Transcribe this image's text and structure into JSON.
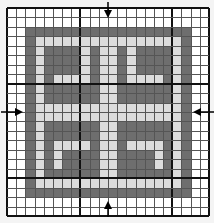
{
  "chart_data": {
    "type": "heatmap",
    "title": "",
    "cols": 22,
    "rows": 22,
    "bold_lines_every": 10,
    "bold_col_lines": [
      8,
      18
    ],
    "bold_row_lines": [
      8,
      18
    ],
    "palette": {
      "0": "#ffffff",
      "1": "#6e6e6e",
      "2": "#dcdcdc"
    },
    "legend": [
      {
        "value": 0,
        "label": "background"
      },
      {
        "value": 1,
        "label": "dark"
      },
      {
        "value": 2,
        "label": "light"
      }
    ],
    "center_markers": {
      "column_center_index": 11,
      "row_center_index": 11,
      "arrows": [
        "top",
        "bottom",
        "left",
        "right"
      ]
    },
    "grid": [
      [
        0,
        0,
        0,
        0,
        0,
        0,
        0,
        0,
        0,
        0,
        0,
        0,
        0,
        0,
        0,
        0,
        0,
        0,
        0,
        0,
        0,
        0
      ],
      [
        0,
        0,
        0,
        0,
        0,
        0,
        0,
        0,
        0,
        0,
        0,
        0,
        0,
        0,
        0,
        0,
        0,
        0,
        0,
        0,
        0,
        0
      ],
      [
        0,
        0,
        1,
        1,
        1,
        1,
        1,
        1,
        1,
        1,
        1,
        1,
        1,
        1,
        1,
        1,
        1,
        1,
        1,
        1,
        0,
        0
      ],
      [
        0,
        0,
        1,
        2,
        2,
        2,
        2,
        2,
        2,
        2,
        2,
        2,
        2,
        2,
        2,
        2,
        2,
        2,
        2,
        1,
        0,
        0
      ],
      [
        0,
        0,
        1,
        2,
        1,
        1,
        1,
        1,
        2,
        1,
        2,
        2,
        1,
        2,
        1,
        1,
        1,
        1,
        2,
        1,
        0,
        0
      ],
      [
        0,
        0,
        1,
        2,
        1,
        1,
        1,
        1,
        2,
        1,
        2,
        2,
        1,
        2,
        1,
        1,
        1,
        1,
        2,
        1,
        0,
        0
      ],
      [
        0,
        0,
        1,
        2,
        1,
        1,
        1,
        1,
        2,
        1,
        2,
        2,
        1,
        2,
        1,
        1,
        1,
        1,
        2,
        1,
        0,
        0
      ],
      [
        0,
        0,
        1,
        2,
        1,
        2,
        2,
        2,
        2,
        1,
        2,
        2,
        1,
        2,
        2,
        2,
        2,
        1,
        2,
        1,
        0,
        0
      ],
      [
        0,
        0,
        1,
        2,
        1,
        1,
        1,
        1,
        1,
        1,
        2,
        2,
        1,
        1,
        1,
        1,
        1,
        1,
        2,
        1,
        0,
        0
      ],
      [
        0,
        0,
        1,
        2,
        1,
        1,
        1,
        1,
        1,
        1,
        2,
        2,
        1,
        1,
        1,
        1,
        1,
        1,
        2,
        1,
        0,
        0
      ],
      [
        0,
        0,
        1,
        2,
        2,
        2,
        2,
        2,
        2,
        2,
        2,
        2,
        2,
        2,
        2,
        2,
        2,
        2,
        2,
        1,
        0,
        0
      ],
      [
        0,
        0,
        1,
        2,
        2,
        2,
        2,
        2,
        2,
        2,
        2,
        2,
        2,
        2,
        2,
        2,
        2,
        2,
        2,
        1,
        0,
        0
      ],
      [
        0,
        0,
        1,
        2,
        1,
        1,
        1,
        1,
        1,
        1,
        2,
        2,
        1,
        1,
        1,
        1,
        1,
        1,
        2,
        1,
        0,
        0
      ],
      [
        0,
        0,
        1,
        2,
        1,
        1,
        1,
        1,
        1,
        1,
        2,
        2,
        1,
        1,
        1,
        1,
        1,
        1,
        2,
        1,
        0,
        0
      ],
      [
        0,
        0,
        1,
        2,
        1,
        2,
        2,
        2,
        2,
        1,
        2,
        2,
        1,
        2,
        2,
        2,
        2,
        1,
        2,
        1,
        0,
        0
      ],
      [
        0,
        0,
        1,
        2,
        1,
        2,
        1,
        1,
        1,
        1,
        2,
        2,
        1,
        1,
        1,
        1,
        2,
        1,
        2,
        1,
        0,
        0
      ],
      [
        0,
        0,
        1,
        2,
        1,
        2,
        1,
        1,
        1,
        1,
        2,
        2,
        1,
        1,
        1,
        1,
        2,
        1,
        2,
        1,
        0,
        0
      ],
      [
        0,
        0,
        1,
        2,
        1,
        1,
        1,
        1,
        1,
        1,
        2,
        2,
        1,
        1,
        1,
        1,
        1,
        1,
        2,
        1,
        0,
        0
      ],
      [
        0,
        0,
        1,
        2,
        2,
        2,
        2,
        2,
        2,
        2,
        2,
        2,
        2,
        2,
        2,
        2,
        2,
        2,
        2,
        1,
        0,
        0
      ],
      [
        0,
        0,
        1,
        1,
        1,
        1,
        1,
        1,
        1,
        1,
        1,
        1,
        1,
        1,
        1,
        1,
        1,
        1,
        1,
        1,
        0,
        0
      ],
      [
        0,
        0,
        0,
        0,
        0,
        0,
        0,
        0,
        0,
        0,
        0,
        0,
        0,
        0,
        0,
        0,
        0,
        0,
        0,
        0,
        0,
        0
      ],
      [
        0,
        0,
        0,
        0,
        0,
        0,
        0,
        0,
        0,
        0,
        0,
        0,
        0,
        0,
        0,
        0,
        0,
        0,
        0,
        0,
        0,
        0
      ]
    ],
    "xlabel": "",
    "ylabel": ""
  },
  "markers": {
    "top": "down-arrow",
    "bottom": "up-arrow",
    "left": "right-arrow",
    "right": "left-arrow"
  }
}
